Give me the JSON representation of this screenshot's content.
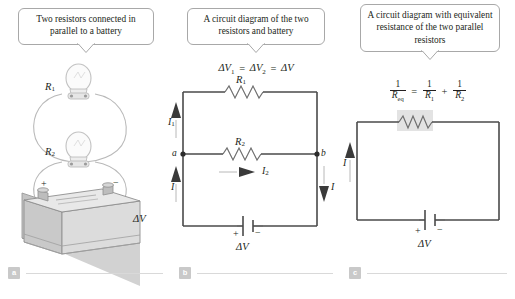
{
  "figure": {
    "panels": [
      {
        "id": "a",
        "tag": "a",
        "callout": "Two resistors connected in parallel to a battery",
        "labels": {
          "r1": "R₁",
          "r2": "R₂",
          "plus": "+",
          "minus": "−",
          "dv": "ΔV"
        }
      },
      {
        "id": "b",
        "tag": "b",
        "callout": "A circuit diagram of the two resistors and battery",
        "equation": "ΔV₁ = ΔV₂ = ΔV",
        "labels": {
          "r1": "R₁",
          "r2": "R₂",
          "node_a": "a",
          "node_b": "b",
          "i1": "I₁",
          "i2": "I₂",
          "i_left": "I",
          "i_right": "I",
          "plus": "+",
          "minus": "−",
          "dv": "ΔV"
        }
      },
      {
        "id": "c",
        "tag": "c",
        "callout": "A circuit diagram with equivalent resistance of the two parallel resistors",
        "equation": {
          "lhs_num": "1",
          "lhs_den": "R_eq",
          "equals": "=",
          "t1_num": "1",
          "t1_den": "R₁",
          "plus": "+",
          "t2_num": "1",
          "t2_den": "R₂"
        },
        "labels": {
          "i_left": "I",
          "plus": "+",
          "minus": "−",
          "dv": "ΔV"
        }
      }
    ],
    "colors": {
      "wire": "#4a4a4a",
      "callout_border": "#a8a8a8",
      "tag_background": "#c9c9c9",
      "resistor_highlight": "#dcdcdc",
      "text": "#231f20",
      "battery_body": "#c6c6c6"
    }
  }
}
